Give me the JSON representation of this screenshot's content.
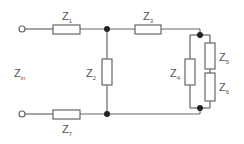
{
  "diagram": {
    "type": "circuit",
    "input_label": {
      "main": "Z",
      "sub": "in"
    },
    "impedances": [
      {
        "id": "Z1",
        "main": "Z",
        "sub": "1"
      },
      {
        "id": "Z2",
        "main": "Z",
        "sub": "2"
      },
      {
        "id": "Z3",
        "main": "Z",
        "sub": "3"
      },
      {
        "id": "Z4",
        "main": "Z",
        "sub": "4"
      },
      {
        "id": "Z5",
        "main": "Z",
        "sub": "5"
      },
      {
        "id": "Z6",
        "main": "Z",
        "sub": "6"
      },
      {
        "id": "Z7",
        "main": "Z",
        "sub": "7"
      }
    ],
    "colors": {
      "wire": "#666666",
      "node": "#222222",
      "text": "#555555"
    }
  }
}
